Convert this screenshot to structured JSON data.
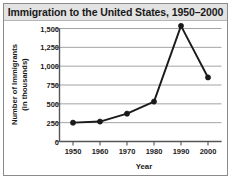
{
  "chart_data": {
    "type": "line",
    "title": "Immigration to the United States, 1950–2000",
    "xlabel": "Year",
    "ylabel_line1": "Number of Immigrants",
    "ylabel_line2": "(in thousands)",
    "x": [
      1950,
      1960,
      1970,
      1980,
      1990,
      2000
    ],
    "xtick_labels": [
      "1950",
      "1960",
      "1970",
      "1980",
      "1990",
      "2000"
    ],
    "values": [
      250,
      265,
      370,
      530,
      1535,
      850
    ],
    "yticks": [
      0,
      250,
      500,
      750,
      1000,
      1250,
      1500
    ],
    "ytick_labels": [
      "0",
      "250",
      "500",
      "750",
      "1,000",
      "1,250",
      "1,500"
    ],
    "ylim": [
      0,
      1535
    ],
    "xlim": [
      1945,
      2005
    ],
    "grid": true,
    "legend": "none",
    "series_name": "Immigrants",
    "line_color": "#1a1a1a",
    "marker_color": "#1a1a1a",
    "grid_color": "#9a9a9a",
    "axis_color": "#555555",
    "title_band_color": "#e3e3e3",
    "background_color": "#ffffff"
  }
}
